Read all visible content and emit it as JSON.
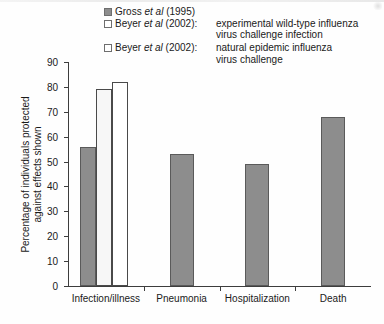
{
  "chart_data": {
    "type": "bar",
    "title": "",
    "xlabel": "",
    "ylabel": "Percentage of individuals protected against effects shown",
    "ylabel_line1": "Percentage of individuals protected",
    "ylabel_line2": "against effects shown",
    "ylim": [
      0,
      90
    ],
    "yticks": [
      0,
      10,
      20,
      30,
      40,
      50,
      60,
      70,
      80,
      90
    ],
    "grid": false,
    "legend_position": "top-right",
    "categories": [
      "Infection/illness",
      "Pneumonia",
      "Hospitalization",
      "Death"
    ],
    "series": [
      {
        "name": "Gross et al (1995)",
        "color": "#8d8d8d",
        "values": [
          56,
          53,
          49,
          68
        ]
      },
      {
        "name": "Beyer et al (2002): experimental wild-type influenza virus challenge infection",
        "color": "#f7f7f7",
        "values": [
          79,
          null,
          null,
          null
        ]
      },
      {
        "name": "Beyer et al (2002): natural epidemic influenza virus challenge",
        "color": "#ffffff",
        "values": [
          82,
          null,
          null,
          null
        ]
      }
    ]
  },
  "legend": {
    "items": [
      {
        "swatch": "filled",
        "cite_pre": "Gross ",
        "cite_italic": "et al",
        "cite_post": " (1995)",
        "desc": "",
        "desc_line2": ""
      },
      {
        "swatch": "open",
        "cite_pre": "Beyer ",
        "cite_italic": "et al",
        "cite_post": " (2002):",
        "desc": "experimental wild-type influenza",
        "desc_line2": "virus challenge infection"
      },
      {
        "swatch": "open",
        "cite_pre": "Beyer ",
        "cite_italic": "et al",
        "cite_post": " (2002):",
        "desc": "natural epidemic influenza",
        "desc_line2": "virus challenge"
      }
    ]
  },
  "axis": {
    "y_labels": [
      "90",
      "80",
      "70",
      "60",
      "50",
      "40",
      "30",
      "20",
      "10",
      "0"
    ],
    "x_labels": [
      "Infection/illness",
      "Pneumonia",
      "Hospitalization",
      "Death"
    ]
  }
}
